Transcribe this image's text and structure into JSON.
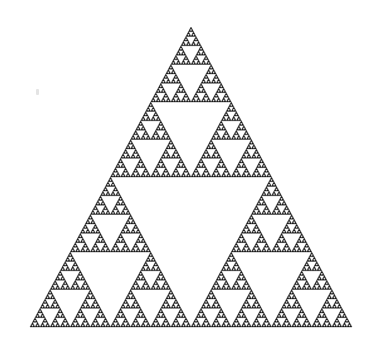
{
  "figure": {
    "background_color": "#ffffff",
    "fill_color": "#1a1a1a",
    "hole_color": "#ffffff",
    "depth": 7,
    "vertices": {
      "apex": [
        191,
        27
      ],
      "bottom_left": [
        30,
        327
      ],
      "bottom_right": [
        352,
        327
      ]
    }
  },
  "artifacts": {
    "stray_mark": {
      "x": 36,
      "y": 89,
      "color": "#d8d8d8"
    }
  }
}
